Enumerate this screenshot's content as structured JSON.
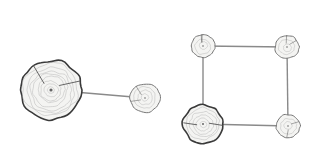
{
  "diagram": {
    "colors": {
      "background": "#ffffff",
      "edge": "#8a8a8a",
      "node_fill": "#f4f4f2",
      "node_outline": "#3a3a3a",
      "ring": "#b5b5b5"
    },
    "graphs": [
      {
        "name": "pair-graph",
        "nodes": [
          {
            "id": "A",
            "x": 51,
            "y": 90,
            "r": 31,
            "icon": "tree-stump-icon"
          },
          {
            "id": "B",
            "x": 145,
            "y": 98,
            "r": 15,
            "icon": "tree-stump-icon"
          }
        ],
        "edges": [
          [
            "A",
            "B"
          ]
        ]
      },
      {
        "name": "square-graph",
        "nodes": [
          {
            "id": "TL",
            "x": 203,
            "y": 46,
            "r": 12,
            "icon": "tree-stump-icon"
          },
          {
            "id": "TR",
            "x": 287,
            "y": 47,
            "r": 12,
            "icon": "tree-stump-icon"
          },
          {
            "id": "BL",
            "x": 203,
            "y": 124,
            "r": 20,
            "icon": "tree-stump-icon"
          },
          {
            "id": "BR",
            "x": 288,
            "y": 126,
            "r": 12,
            "icon": "tree-stump-icon"
          }
        ],
        "edges": [
          [
            "TL",
            "TR"
          ],
          [
            "TR",
            "BR"
          ],
          [
            "BR",
            "BL"
          ],
          [
            "BL",
            "TL"
          ]
        ]
      }
    ]
  }
}
